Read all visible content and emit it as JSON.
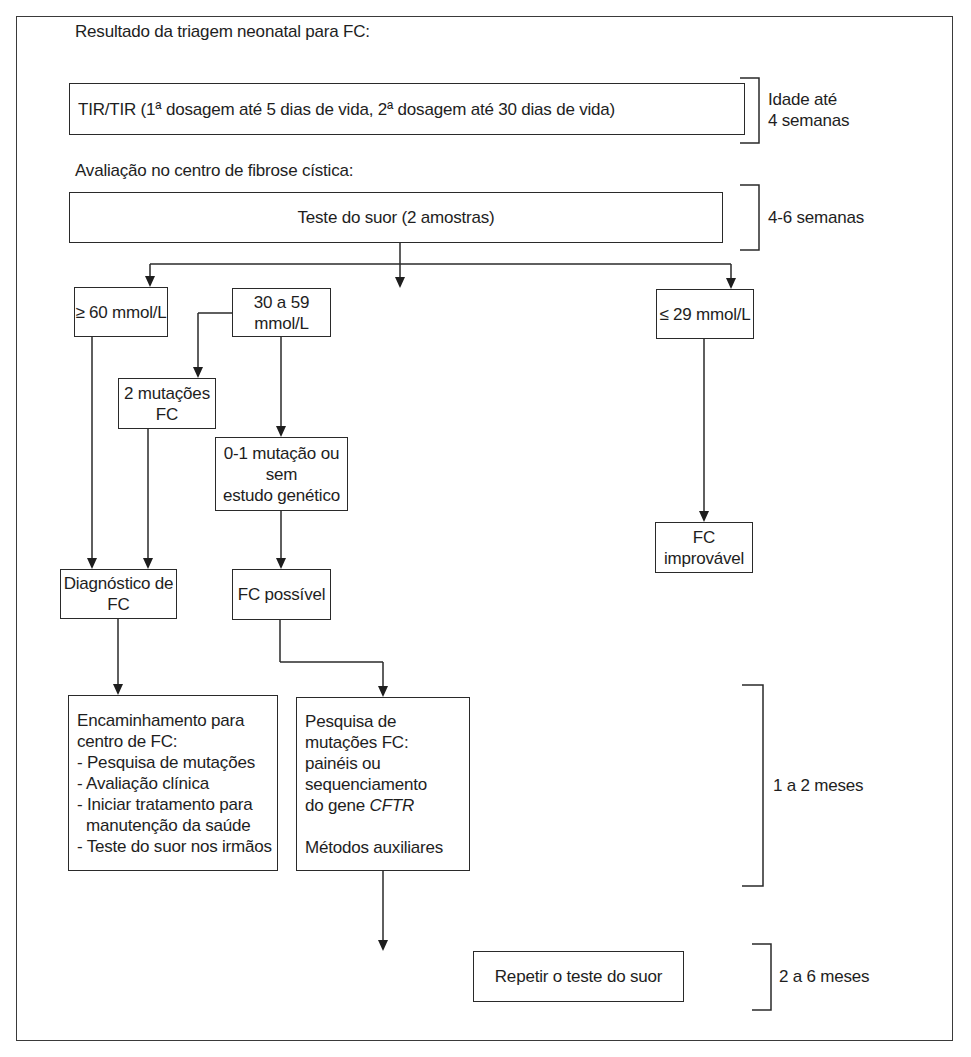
{
  "flowchart": {
    "section_titles": {
      "screening_result": "Resultado da triagem neonatal para FC:",
      "cf_center_evaluation": "Avaliação no centro de fibrose cística:"
    },
    "nodes": {
      "tir": "TIR/TIR (1ª dosagem até 5 dias de vida, 2ª dosagem até 30 dias de vida)",
      "sweat_test": "Teste do suor (2 amostras)",
      "high": "≥ 60 mmol/L",
      "mid": "30 a 59 mmol/L",
      "low": "≤ 29 mmol/L",
      "two_mutations": "2 mutações FC",
      "zero_one_mutation": {
        "line1": "0-1 mutação ou sem",
        "line2": "estudo genético"
      },
      "cf_unlikely": "FC improvável",
      "cf_diagnosis": "Diagnóstico de FC",
      "cf_possible": "FC possível",
      "referral": {
        "title": "Encaminhamento para centro de FC:",
        "items": [
          "- Pesquisa de mutações",
          "- Avaliação clínica",
          "- Iniciar tratamento para",
          "  manutenção da saúde",
          "- Teste do suor nos irmãos"
        ]
      },
      "mutation_research": {
        "line1": "Pesquisa de mutações FC:",
        "line2": "painéis ou sequenciamento",
        "line3_prefix": "do gene ",
        "line3_italic": "CFTR",
        "line4": "Métodos auxiliares"
      },
      "repeat_sweat_test": "Repetir o teste do suor"
    },
    "timeline": [
      {
        "line1": "Idade até",
        "line2": "4 semanas"
      },
      {
        "line1": "4-6 semanas"
      },
      {
        "line1": "1 a 2 meses"
      },
      {
        "line1": "2 a 6 meses"
      }
    ],
    "colors": {
      "line": "#2a2a2a",
      "text": "#1e1e1e",
      "background": "#ffffff"
    }
  }
}
